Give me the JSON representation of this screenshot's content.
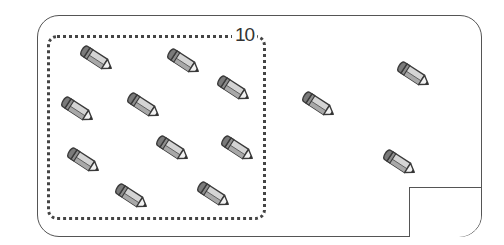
{
  "worksheet": {
    "group_label": "10",
    "answer_value": "",
    "item_icon": "pencil-icon",
    "colors": {
      "outline": "#555555",
      "dotted_group": "#444444",
      "pencil_eraser": "#7a7a7a",
      "pencil_body": "#d4d4d4",
      "pencil_stripe": "#a8a8a8",
      "pencil_tip": "#f2f2f2",
      "pencil_lead": "#333333"
    },
    "grouped_count": 10,
    "ungrouped_count": 3,
    "pencils": [
      {
        "id": 1,
        "x": 79,
        "y": 45,
        "group": "inside"
      },
      {
        "id": 2,
        "x": 166,
        "y": 48,
        "group": "inside"
      },
      {
        "id": 3,
        "x": 216,
        "y": 75,
        "group": "inside"
      },
      {
        "id": 4,
        "x": 60,
        "y": 96,
        "group": "inside"
      },
      {
        "id": 5,
        "x": 126,
        "y": 92,
        "group": "inside"
      },
      {
        "id": 6,
        "x": 66,
        "y": 147,
        "group": "inside"
      },
      {
        "id": 7,
        "x": 155,
        "y": 135,
        "group": "inside"
      },
      {
        "id": 8,
        "x": 220,
        "y": 135,
        "group": "inside"
      },
      {
        "id": 9,
        "x": 114,
        "y": 183,
        "group": "inside"
      },
      {
        "id": 10,
        "x": 196,
        "y": 181,
        "group": "inside"
      },
      {
        "id": 11,
        "x": 301,
        "y": 91,
        "group": "outside"
      },
      {
        "id": 12,
        "x": 396,
        "y": 61,
        "group": "outside"
      },
      {
        "id": 13,
        "x": 382,
        "y": 149,
        "group": "outside"
      }
    ]
  }
}
